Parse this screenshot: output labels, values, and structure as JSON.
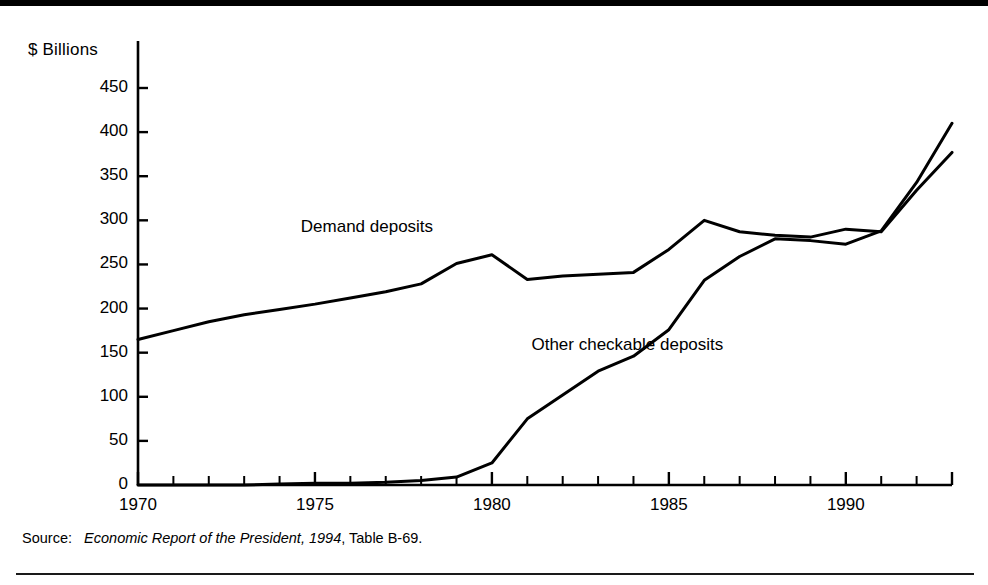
{
  "figure": {
    "y_axis_unit_label": "$ Billions",
    "source_prefix": "Source:",
    "source_italic": "Economic Report of the President, 1994",
    "source_suffix": ", Table B-69.",
    "line_color": "#000000",
    "background_color": "#ffffff"
  },
  "chart_data": {
    "type": "line",
    "title": "",
    "subtitle": "",
    "xlabel": "",
    "ylabel": "$ Billions",
    "xlim": [
      1970,
      1993
    ],
    "ylim": [
      0,
      475
    ],
    "yticks": [
      0,
      50,
      100,
      150,
      200,
      250,
      300,
      350,
      400,
      450
    ],
    "ytick_labels": [
      "0",
      "50",
      "100",
      "150",
      "200",
      "250",
      "300",
      "350",
      "400",
      "450"
    ],
    "xticks": [
      1970,
      1975,
      1980,
      1985,
      1990
    ],
    "xtick_labels": [
      "1970",
      "1975",
      "1980",
      "1985",
      "1990"
    ],
    "minor_xticks_every": 1,
    "grid": false,
    "legend": "inline-annotations",
    "x": [
      1970,
      1971,
      1972,
      1973,
      1974,
      1975,
      1976,
      1977,
      1978,
      1979,
      1980,
      1981,
      1982,
      1983,
      1984,
      1985,
      1986,
      1987,
      1988,
      1989,
      1990,
      1991,
      1992,
      1993
    ],
    "series": [
      {
        "name": "Demand deposits",
        "label_text": "Demand deposits",
        "values": [
          165,
          175,
          185,
          193,
          199,
          205,
          212,
          219,
          228,
          251,
          261,
          233,
          237,
          239,
          241,
          267,
          300,
          287,
          283,
          281,
          290,
          287,
          334,
          377
        ]
      },
      {
        "name": "Other checkable deposits",
        "label_text": "Other checkable\ndeposits",
        "values": [
          0,
          0,
          0,
          0,
          1,
          2,
          2,
          3,
          5,
          9,
          25,
          75,
          102,
          129,
          146,
          176,
          232,
          259,
          279,
          277,
          273,
          288,
          343,
          410
        ]
      }
    ],
    "annotations": [
      {
        "text": "Demand deposits",
        "x": 1974.6,
        "y": 292
      },
      {
        "text": "Other checkable deposits",
        "x": 1981.4,
        "y": 158
      }
    ]
  }
}
